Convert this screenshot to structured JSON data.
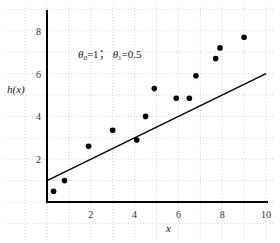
{
  "chart_data": {
    "type": "scatter",
    "title": "",
    "xlabel": "x",
    "ylabel": "h(x)",
    "xlim": [
      0,
      10
    ],
    "ylim": [
      0,
      9
    ],
    "grid": true,
    "x_ticks": [
      "2",
      "4",
      "6",
      "8",
      "10"
    ],
    "y_ticks": [
      "2",
      "4",
      "6",
      "8"
    ],
    "annotation": "θ0=1; θ1=0.5",
    "annotation_parts": {
      "theta0_sym": "θ",
      "theta0_sub": "0",
      "theta0_val": "=1；",
      "theta1_sym": "θ",
      "theta1_sub": "1",
      "theta1_val": "=0.5"
    },
    "series": [
      {
        "name": "data points",
        "type": "scatter",
        "x": [
          0.3,
          0.8,
          1.9,
          3.0,
          4.1,
          4.5,
          4.9,
          5.9,
          6.5,
          6.8,
          7.7,
          7.9,
          9.0
        ],
        "y": [
          0.5,
          1.0,
          2.6,
          3.35,
          2.9,
          4.0,
          5.3,
          4.85,
          4.85,
          5.9,
          6.7,
          7.2,
          7.7
        ]
      },
      {
        "name": "hypothesis h(x)=θ0+θ1·x",
        "type": "line",
        "x": [
          0,
          10
        ],
        "y": [
          1,
          6
        ]
      }
    ],
    "colors": {
      "points": "#000000",
      "line": "#000000",
      "axes": "#000000",
      "grid": "#bbbbbb"
    }
  }
}
